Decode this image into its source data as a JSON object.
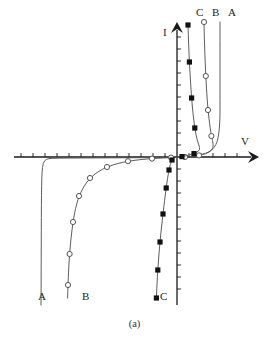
{
  "figure": {
    "caption": "(a)",
    "axes": {
      "x_label": "V",
      "y_label": "I",
      "x_arrow": "arrow-right",
      "y_arrow": "arrow-up",
      "origin_x": 177,
      "origin_y": 157,
      "x_min_px": 14,
      "x_max_px": 259,
      "y_top_px": 22,
      "y_bottom_px": 305,
      "x_tick_spacing": 12,
      "y_tick_spacing": 12,
      "tick_len": 4,
      "grid": false
    },
    "top_labels": [
      {
        "text": "C",
        "x": 196,
        "y": 16
      },
      {
        "text": "B",
        "x": 212,
        "y": 16
      },
      {
        "text": "A",
        "x": 228,
        "y": 16
      }
    ],
    "bottom_labels": [
      {
        "text": "A",
        "x": 38,
        "y": 300
      },
      {
        "text": "B",
        "x": 82,
        "y": 300
      },
      {
        "text": "C",
        "x": 160,
        "y": 300
      }
    ],
    "colors": {
      "axis": "#1a1a1a",
      "curve": "#555555",
      "marker_open": "#ffffff",
      "marker_edge": "#444444",
      "marker_fill": "#111111",
      "background": "#ffffff"
    }
  },
  "chart_data": {
    "type": "line",
    "title": "",
    "xlabel": "V",
    "ylabel": "I",
    "grid": false,
    "legend": "none",
    "annotations": [
      "(a)"
    ],
    "series": [
      {
        "name": "A",
        "marker": "none",
        "points_px": [
          [
            220,
            22
          ],
          [
            220,
            40
          ],
          [
            220,
            60
          ],
          [
            220,
            80
          ],
          [
            220,
            100
          ],
          [
            220,
            118
          ],
          [
            219.4,
            128
          ],
          [
            218.2,
            138
          ],
          [
            216,
            145
          ],
          [
            212,
            150
          ],
          [
            206,
            153.5
          ],
          [
            198,
            155.5
          ],
          [
            190,
            156.6
          ],
          [
            182,
            157.1
          ],
          [
            177,
            157.3
          ],
          [
            172,
            157.4
          ],
          [
            165,
            157.5
          ],
          [
            155,
            157.6
          ],
          [
            140,
            157.7
          ],
          [
            120,
            157.8
          ],
          [
            100,
            157.9
          ],
          [
            80,
            158.0
          ],
          [
            62,
            158.1
          ],
          [
            52,
            158.3
          ],
          [
            46,
            159
          ],
          [
            43,
            163
          ],
          [
            42,
            172
          ],
          [
            41.6,
            186
          ],
          [
            41.4,
            205
          ],
          [
            41.3,
            230
          ],
          [
            41.2,
            260
          ],
          [
            41.1,
            290
          ],
          [
            41,
            305
          ]
        ]
      },
      {
        "name": "B",
        "marker": "circle-open",
        "points_px": [
          [
            204,
            22
          ],
          [
            204.4,
            40
          ],
          [
            205,
            58
          ],
          [
            205.8,
            76
          ],
          [
            206.8,
            94
          ],
          [
            208,
            110
          ],
          [
            209.6,
            124
          ],
          [
            211.4,
            136
          ],
          [
            213.6,
            145
          ],
          [
            212,
            150.5
          ],
          [
            206,
            153.6
          ],
          [
            199,
            155.4
          ],
          [
            192,
            156.4
          ],
          [
            185,
            157.0
          ],
          [
            178,
            157.3
          ],
          [
            171,
            157.6
          ],
          [
            163,
            158.0
          ],
          [
            152,
            158.6
          ],
          [
            140,
            159.6
          ],
          [
            128,
            161.2
          ],
          [
            117,
            163.6
          ],
          [
            107,
            167
          ],
          [
            98,
            171.6
          ],
          [
            90,
            178
          ],
          [
            84,
            186
          ],
          [
            79,
            196
          ],
          [
            75.5,
            208
          ],
          [
            73,
            222
          ],
          [
            71,
            238
          ],
          [
            69.6,
            254
          ],
          [
            68.6,
            270
          ],
          [
            68,
            285
          ],
          [
            67.6,
            298
          ]
        ],
        "markers_px": [
          [
            204,
            22
          ],
          [
            205.8,
            76
          ],
          [
            208,
            110
          ],
          [
            211.4,
            136
          ],
          [
            199,
            155.4
          ],
          [
            185,
            157.0
          ],
          [
            171,
            157.6
          ],
          [
            152,
            158.6
          ],
          [
            128,
            161.2
          ],
          [
            107,
            167
          ],
          [
            90,
            178
          ],
          [
            79,
            196
          ],
          [
            73,
            222
          ],
          [
            69.6,
            254
          ],
          [
            68,
            285
          ]
        ]
      },
      {
        "name": "C",
        "marker": "square-filled",
        "points_px": [
          [
            188,
            25
          ],
          [
            188.6,
            44
          ],
          [
            189.4,
            62
          ],
          [
            190.4,
            80
          ],
          [
            191.6,
            98
          ],
          [
            193,
            114
          ],
          [
            194.8,
            128
          ],
          [
            197,
            140
          ],
          [
            200,
            148
          ],
          [
            199,
            151
          ],
          [
            194,
            153.6
          ],
          [
            188,
            155.4
          ],
          [
            182,
            156.6
          ],
          [
            177,
            157.2
          ],
          [
            174,
            158
          ],
          [
            172,
            160
          ],
          [
            170.4,
            164
          ],
          [
            169,
            170
          ],
          [
            167.6,
            178
          ],
          [
            166.2,
            188
          ],
          [
            164.6,
            200
          ],
          [
            163,
            214
          ],
          [
            161.4,
            228
          ],
          [
            160,
            242
          ],
          [
            158.8,
            256
          ],
          [
            157.8,
            270
          ],
          [
            157,
            284
          ],
          [
            156.4,
            298
          ]
        ],
        "markers_px": [
          [
            188,
            25
          ],
          [
            189.4,
            62
          ],
          [
            191.6,
            98
          ],
          [
            194.8,
            128
          ],
          [
            194,
            153.6
          ],
          [
            182,
            156.6
          ],
          [
            172,
            160
          ],
          [
            169,
            170
          ],
          [
            166.2,
            188
          ],
          [
            163,
            214
          ],
          [
            160,
            242
          ],
          [
            157.8,
            270
          ],
          [
            156.4,
            298
          ]
        ]
      }
    ]
  }
}
